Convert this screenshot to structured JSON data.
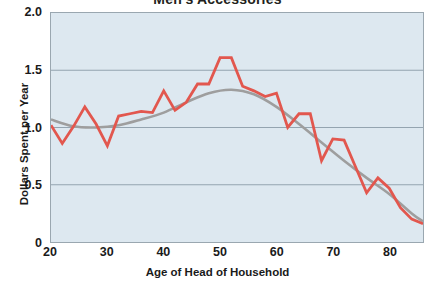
{
  "chart_data": {
    "type": "line",
    "title": "Men's Accessories",
    "xlabel": "Age of Head of Household",
    "ylabel": "Dollars Spent per Year",
    "xlim": [
      20,
      86
    ],
    "ylim": [
      0,
      2.0
    ],
    "xticks": [
      20,
      30,
      40,
      50,
      60,
      70,
      80
    ],
    "xtick_labels": [
      "20",
      "30",
      "40",
      "50",
      "60",
      "70",
      "80"
    ],
    "yticks": [
      0,
      0.5,
      1.0,
      1.5,
      2.0
    ],
    "ytick_labels": [
      "0",
      "0.5",
      "1.0",
      "1.5",
      "2.0"
    ],
    "grid": true,
    "grid_axis": "y",
    "legend": "none",
    "plot_background": "#dde8f0",
    "figure_background": "#ffffff",
    "series": [
      {
        "name": "Dollars Spent per Year",
        "style": "jagged-raw",
        "color": "#e2574e",
        "x": [
          20,
          22,
          24,
          26,
          28,
          30,
          32,
          34,
          36,
          38,
          40,
          42,
          44,
          46,
          48,
          50,
          52,
          54,
          56,
          58,
          60,
          62,
          64,
          66,
          68,
          70,
          72,
          74,
          76,
          78,
          80,
          82,
          84,
          86
        ],
        "values": [
          1.02,
          0.86,
          1.01,
          1.18,
          1.03,
          0.84,
          1.1,
          1.12,
          1.14,
          1.13,
          1.32,
          1.15,
          1.22,
          1.38,
          1.38,
          1.61,
          1.61,
          1.36,
          1.32,
          1.27,
          1.3,
          1.0,
          1.12,
          1.12,
          0.71,
          0.9,
          0.89,
          0.66,
          0.43,
          0.56,
          0.47,
          0.3,
          0.2,
          0.16
        ]
      },
      {
        "name": "Smoothed trend",
        "style": "smooth-trend",
        "color": "#9e9e9e",
        "x": [
          20,
          24,
          28,
          32,
          36,
          40,
          44,
          48,
          52,
          56,
          60,
          64,
          68,
          72,
          76,
          80,
          84,
          86
        ],
        "values": [
          1.07,
          1.01,
          1.0,
          1.02,
          1.07,
          1.13,
          1.22,
          1.3,
          1.33,
          1.29,
          1.18,
          1.03,
          0.87,
          0.71,
          0.56,
          0.42,
          0.25,
          0.18
        ]
      }
    ]
  }
}
